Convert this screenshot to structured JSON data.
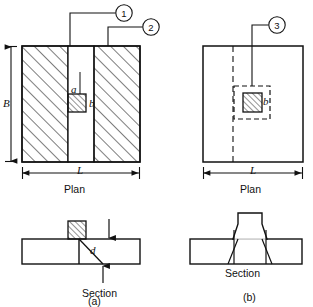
{
  "figure": {
    "title": "",
    "panels": [
      {
        "key": "a",
        "caption": "(a)",
        "plan_label": "Plan",
        "section_label": "Section",
        "dimension_vertical": "B",
        "dimension_horizontal": "L",
        "column_width_label": "a",
        "column_depth_label": "b",
        "slab_depth_label": "d",
        "callouts": [
          "1",
          "2"
        ]
      },
      {
        "key": "b",
        "caption": "(b)",
        "plan_label": "Plan",
        "section_label": "Section",
        "dimension_horizontal": "L",
        "column_depth_label": "b",
        "callouts": [
          "3"
        ]
      }
    ]
  },
  "colors": {
    "line": "#111111",
    "hatch": "#111111",
    "background": "#ffffff"
  }
}
